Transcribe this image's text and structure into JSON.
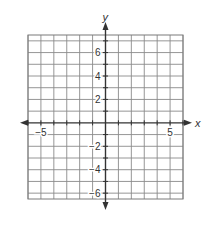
{
  "chart_data": {
    "type": "scatter",
    "title": "",
    "xlabel": "x",
    "ylabel": "y",
    "xlim": [
      -6,
      6
    ],
    "ylim": [
      -6.5,
      7.5
    ],
    "grid": true,
    "grid_step": 1,
    "x_ticks": [
      {
        "value": -5,
        "label": "−5"
      },
      {
        "value": 5,
        "label": "5"
      }
    ],
    "y_ticks": [
      {
        "value": 6,
        "label": "6"
      },
      {
        "value": 4,
        "label": "4"
      },
      {
        "value": 2,
        "label": "2"
      },
      {
        "value": -2,
        "label": "−2"
      },
      {
        "value": -4,
        "label": "−4"
      },
      {
        "value": -6,
        "label": "−6"
      }
    ],
    "series": []
  },
  "colors": {
    "grid": "#8a8a8a",
    "axis": "#333333",
    "border": "#7a7a7a",
    "text": "#333333"
  }
}
